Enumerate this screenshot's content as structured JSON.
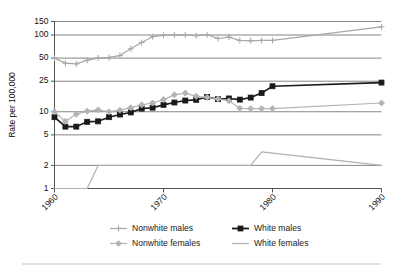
{
  "chart_data": {
    "type": "line",
    "title": "",
    "xlabel": "",
    "ylabel": "Rate per 100,000",
    "yscale": "log",
    "ylim": [
      1,
      150
    ],
    "xlim": [
      1960,
      1990
    ],
    "grid": true,
    "legend_position": "bottom",
    "ytick_labels": [
      "150",
      "100",
      "50",
      "25",
      "10",
      "5",
      "2",
      "1"
    ],
    "ytick_values": [
      150,
      100,
      50,
      25,
      10,
      5,
      2,
      1
    ],
    "xtick_labels": [
      "1960",
      "1970",
      "1980",
      "1990"
    ],
    "xtick_values": [
      1960,
      1970,
      1980,
      1990
    ],
    "series": [
      {
        "name": "Nonwhite males",
        "color": "#a8a8a8",
        "marker": "cross",
        "x": [
          1960,
          1961,
          1962,
          1963,
          1964,
          1965,
          1966,
          1967,
          1968,
          1969,
          1970,
          1971,
          1972,
          1973,
          1974,
          1975,
          1976,
          1977,
          1978,
          1979,
          1980,
          1990
        ],
        "values": [
          50,
          43,
          42,
          47,
          50,
          51,
          54,
          66,
          80,
          95,
          99,
          101,
          100,
          98,
          101,
          90,
          94,
          85,
          84,
          85,
          85,
          128
        ]
      },
      {
        "name": "White males",
        "color": "#1a1a1a",
        "marker": "square",
        "x": [
          1960,
          1961,
          1962,
          1963,
          1964,
          1965,
          1966,
          1967,
          1968,
          1969,
          1970,
          1971,
          1972,
          1973,
          1974,
          1975,
          1976,
          1977,
          1978,
          1979,
          1980,
          1990
        ],
        "values": [
          8.5,
          6.4,
          6.4,
          7.4,
          7.5,
          8.5,
          9.2,
          9.8,
          11.0,
          11.3,
          12.3,
          13.2,
          14.0,
          14.3,
          15.6,
          14.6,
          14.9,
          14.4,
          15.3,
          17.5,
          21.5,
          24.0
        ]
      },
      {
        "name": "Nonwhite females",
        "color": "#b3b3b3",
        "marker": "diamond",
        "x": [
          1960,
          1961,
          1962,
          1963,
          1964,
          1965,
          1966,
          1967,
          1968,
          1969,
          1970,
          1971,
          1972,
          1973,
          1974,
          1975,
          1976,
          1977,
          1978,
          1979,
          1980,
          1990
        ],
        "values": [
          10.0,
          7.5,
          9.3,
          10.2,
          10.6,
          10.0,
          10.5,
          11.3,
          12.3,
          13.0,
          14.4,
          16.6,
          17.5,
          15.9,
          15.4,
          14.7,
          13.9,
          11.1,
          11.0,
          11.0,
          11.0,
          13.0
        ]
      },
      {
        "name": "White females",
        "color": "#b0b0b0",
        "marker": "none",
        "x": [
          1960,
          1963,
          1964,
          1978,
          1979,
          1990
        ],
        "values": [
          1.0,
          1.0,
          2.0,
          2.0,
          3.0,
          2.0
        ]
      }
    ]
  },
  "legend": {
    "items": [
      {
        "label": "Nonwhite males"
      },
      {
        "label": "White males"
      },
      {
        "label": "Nonwhite females"
      },
      {
        "label": "White females"
      }
    ]
  }
}
